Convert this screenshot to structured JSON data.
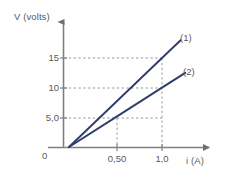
{
  "chart_data": {
    "type": "line",
    "title": "",
    "subtitle": "",
    "xlabel": "i (A)",
    "ylabel": "V (volts)",
    "xlim": [
      0,
      1.3
    ],
    "ylim": [
      0,
      18.5
    ],
    "grid": true,
    "grid_style": "dashed",
    "legend_position": "inline-right-end",
    "origin_label": "0",
    "xticks": [
      {
        "value": 0.5,
        "label": "0,50"
      },
      {
        "value": 1.0,
        "label": "1,0"
      }
    ],
    "yticks": [
      {
        "value": 5,
        "label": "5,0"
      },
      {
        "value": 10,
        "label": "10"
      },
      {
        "value": 15,
        "label": "15"
      }
    ],
    "series": [
      {
        "name": "(1)",
        "label": "(1)",
        "color": "#2e3d6b",
        "slope_ohms": 15,
        "x": [
          0,
          1.0,
          1.2
        ],
        "values": [
          0,
          15,
          18
        ]
      },
      {
        "name": "(2)",
        "label": "(2)",
        "color": "#2e3d6b",
        "slope_ohms": 10,
        "x": [
          0,
          0.5,
          1.0,
          1.25
        ],
        "values": [
          0,
          5,
          10,
          12.5
        ]
      }
    ],
    "annotations": []
  },
  "style": {
    "line_color": "#2e3d6b",
    "axis_color": "#808080",
    "grid_color": "#9a9a9a",
    "text_color": "#5a5a5a",
    "background": "#ffffff"
  }
}
